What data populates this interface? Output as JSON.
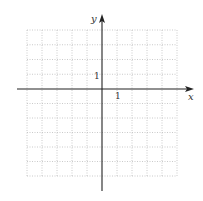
{
  "diagram": {
    "type": "coordinate-grid",
    "axes": {
      "x_label": "x",
      "y_label": "y",
      "x_tick_label": "1",
      "y_tick_label": "1"
    },
    "grid": {
      "columns_left_of_y_axis": 5,
      "columns_right_of_y_axis": 5,
      "rows_above_x_axis": 4,
      "rows_below_x_axis": 6,
      "line_style": "dotted"
    },
    "colors": {
      "axis": "#222222",
      "grid": "#bdbdbd",
      "label": "#333333"
    }
  }
}
